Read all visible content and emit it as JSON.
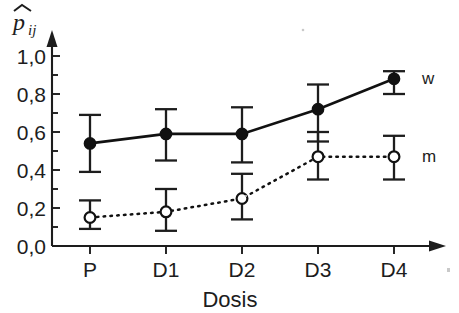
{
  "chart_data": {
    "type": "line",
    "title": "",
    "subtitle": "",
    "xlabel": "Dosis",
    "ylabel": "p̂ij",
    "ylabel_parts": {
      "symbol": "p",
      "hat": true,
      "subscript": "ij"
    },
    "categories": [
      "P",
      "D1",
      "D2",
      "D3",
      "D4"
    ],
    "xtick_labels": [
      "P",
      "D1",
      "D2",
      "D3",
      "D4"
    ],
    "ytick_labels": [
      "0,0",
      "0,2",
      "0,4",
      "0,6",
      "0,8",
      "1,0"
    ],
    "ytick_values": [
      0.0,
      0.2,
      0.4,
      0.6,
      0.8,
      1.0
    ],
    "ylim": [
      0.0,
      1.0
    ],
    "grid": false,
    "legend_position": "right-inline",
    "error_bars": true,
    "series": [
      {
        "name": "w",
        "label": "w",
        "marker": "filled-circle",
        "linestyle": "solid",
        "color": "#111111",
        "values": [
          0.54,
          0.59,
          0.59,
          0.72,
          0.88
        ],
        "err_low": [
          0.39,
          0.45,
          0.44,
          0.55,
          0.8
        ],
        "err_high": [
          0.69,
          0.72,
          0.73,
          0.85,
          0.92
        ]
      },
      {
        "name": "m",
        "label": "m",
        "marker": "open-circle",
        "linestyle": "dotted",
        "color": "#111111",
        "values": [
          0.15,
          0.18,
          0.25,
          0.47,
          0.47
        ],
        "err_low": [
          0.09,
          0.08,
          0.14,
          0.35,
          0.35
        ],
        "err_high": [
          0.24,
          0.3,
          0.38,
          0.6,
          0.58
        ]
      }
    ]
  },
  "figure": {
    "y_axis_name": "y-axis",
    "x_axis_name": "x-axis",
    "background": "#ffffff",
    "ink": "#111111"
  }
}
